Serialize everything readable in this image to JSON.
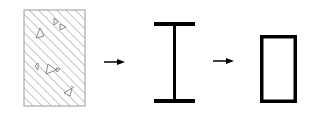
{
  "diagram": {
    "type": "section-transformation",
    "background": "#ffffff",
    "stroke_color": "#000000",
    "hatch_color": "#8a8a8a",
    "steps": [
      {
        "id": "concrete-section",
        "shape": "hatched-rectangle",
        "fill_pattern": "diagonal-hatch-with-aggregate"
      },
      {
        "id": "steel-i-section",
        "shape": "i-beam"
      },
      {
        "id": "hollow-section",
        "shape": "rectangle-outline"
      }
    ],
    "arrows": [
      {
        "from": "concrete-section",
        "to": "steel-i-section"
      },
      {
        "from": "steel-i-section",
        "to": "hollow-section"
      }
    ],
    "icons": {
      "concrete": "hatched-concrete-section-icon",
      "ibeam": "i-beam-section-icon",
      "hollow": "hollow-rectangle-section-icon",
      "arrow": "right-arrow-icon"
    }
  }
}
